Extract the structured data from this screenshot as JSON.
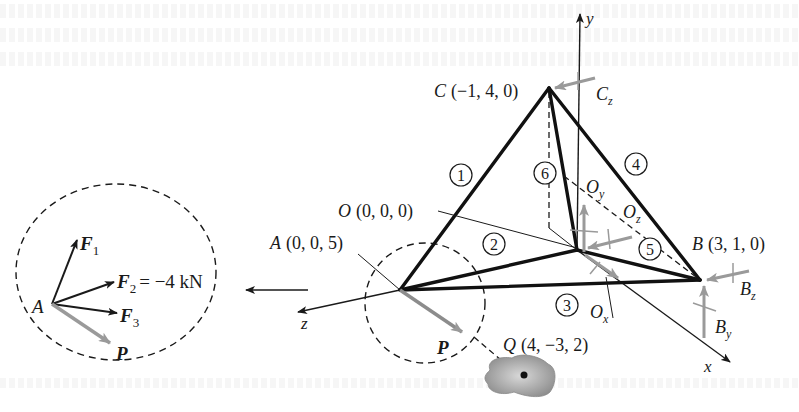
{
  "figure": {
    "axes": {
      "x": "x",
      "y": "y",
      "z": "z"
    },
    "points": {
      "O": {
        "name": "O",
        "coords": "(0, 0, 0)"
      },
      "A": {
        "name": "A",
        "coords": "(0, 0, 5)"
      },
      "B": {
        "name": "B",
        "coords": "(3, 1, 0)"
      },
      "C": {
        "name": "C",
        "coords": "(−1, 4, 0)"
      },
      "Q": {
        "name": "Q",
        "coords": "(4, −3, 2)"
      }
    },
    "members": [
      "1",
      "2",
      "3",
      "4",
      "5",
      "6"
    ],
    "reactions": {
      "Cz": {
        "main": "C",
        "sub": "z"
      },
      "Oy": {
        "main": "O",
        "sub": "y"
      },
      "Oz": {
        "main": "O",
        "sub": "z"
      },
      "Ox": {
        "main": "O",
        "sub": "x"
      },
      "Bz": {
        "main": "B",
        "sub": "z"
      },
      "By": {
        "main": "B",
        "sub": "y"
      }
    },
    "detail": {
      "joint": "A",
      "F1": {
        "main": "F",
        "sub": "1"
      },
      "F2": {
        "main": "F",
        "sub": "2",
        "value": "= −4 kN"
      },
      "F3": {
        "main": "F",
        "sub": "3"
      },
      "P": "P"
    },
    "load_label": "P",
    "colors": {
      "ink": "#1a1a1a",
      "reaction": "#9a9a9a",
      "load": "#8c8c8c",
      "blob": "#8f8f8f"
    }
  }
}
